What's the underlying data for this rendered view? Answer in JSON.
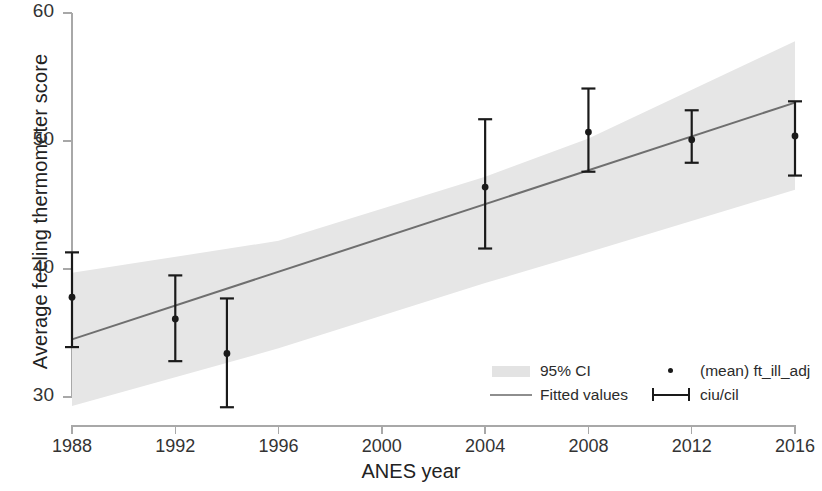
{
  "chart_data": {
    "type": "scatter",
    "title": "",
    "xlabel": "ANES year",
    "ylabel": "Average feeling thermometer score",
    "xlim": [
      1988,
      2016
    ],
    "ylim": [
      28,
      60
    ],
    "grid": false,
    "legend_position": "bottom-right",
    "x": [
      1988,
      1992,
      1994,
      2004,
      2008,
      2012,
      2016
    ],
    "categories": [
      "1988",
      "1992",
      "1994",
      "2004",
      "2008",
      "2012",
      "2016"
    ],
    "series": [
      {
        "name": "(mean) ft_ill_adj",
        "type": "scatter",
        "values": [
          37.8,
          36.1,
          33.4,
          46.4,
          50.7,
          50.1,
          50.4
        ]
      },
      {
        "name": "ciu/cil",
        "type": "errorbar",
        "lower": [
          33.9,
          32.8,
          29.2,
          41.6,
          47.6,
          48.3,
          47.3
        ],
        "upper": [
          41.3,
          39.5,
          37.7,
          51.7,
          54.1,
          52.4,
          53.1
        ]
      },
      {
        "name": "Fitted values",
        "type": "line",
        "x": [
          1988,
          2016
        ],
        "values": [
          34.5,
          53.0
        ]
      },
      {
        "name": "95% CI",
        "type": "band",
        "x": [
          1988,
          1996,
          2004,
          2008,
          2016
        ],
        "lower": [
          29.3,
          33.8,
          38.9,
          41.3,
          46.2
        ],
        "upper": [
          39.7,
          42.2,
          47.2,
          50.2,
          57.8
        ]
      }
    ],
    "xticks": [
      1988,
      1992,
      1996,
      2000,
      2004,
      2008,
      2012,
      2016
    ],
    "xtick_labels": [
      "1988",
      "1992",
      "1996",
      "2000",
      "2004",
      "2008",
      "2012",
      "2016"
    ],
    "yticks": [
      30,
      40,
      50,
      60
    ],
    "ytick_labels": [
      "30",
      "40",
      "50",
      "60"
    ],
    "colors": {
      "ci_band": "#e6e6e6",
      "fitted_line": "#6f6f6f",
      "marker": "#1a1a1a",
      "errorbar": "#1a1a1a",
      "axis": "#a8a8a8",
      "text": "#2b2b2b"
    }
  },
  "axes": {
    "y_title": "Average feeling thermometer score",
    "x_title": "ANES year",
    "y_labels": [
      "60",
      "50",
      "40",
      "30"
    ],
    "x_labels": [
      "1988",
      "1992",
      "1996",
      "2000",
      "2004",
      "2008",
      "2012",
      "2016"
    ]
  },
  "legend": {
    "items": [
      {
        "key": "ci-band-swatch",
        "label": "95% CI"
      },
      {
        "key": "fitted-line-swatch",
        "label": "Fitted values"
      },
      {
        "key": "mean-dot-swatch",
        "label": "(mean) ft_ill_adj"
      },
      {
        "key": "errorbar-swatch",
        "label": "ciu/cil"
      }
    ]
  }
}
